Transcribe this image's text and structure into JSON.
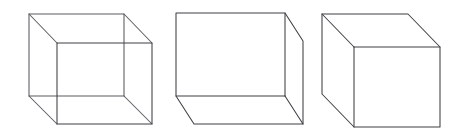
{
  "figure": {
    "name": "three-cube-drawings",
    "width": 460,
    "height": 136,
    "background_color": "#ffffff",
    "line_color": "#3f3f44",
    "hidden_line_color": "#5a5a60",
    "line_width": 1.05,
    "caption": "",
    "cubes": [
      {
        "id": "cube-wireframe",
        "label": "",
        "style": "wireframe-all-edges",
        "visible_edge_count": 12,
        "hidden_edges_drawn": true,
        "projection": "oblique-back-upper-left",
        "front_face": {
          "top_left": [
            57,
            43
          ],
          "top_right": [
            152,
            43
          ],
          "bottom_right": [
            152,
            124
          ],
          "bottom_left": [
            57,
            124
          ]
        },
        "back_face": {
          "top_left": [
            29,
            14
          ],
          "top_right": [
            124,
            14
          ],
          "bottom_right": [
            124,
            96
          ],
          "bottom_left": [
            29,
            96
          ]
        },
        "depth_offset": [
          -28,
          -29
        ]
      },
      {
        "id": "cube-hidden-removed-low",
        "label": "",
        "style": "hidden-lines-removed",
        "visible_edge_count": 9,
        "hidden_edges_drawn": false,
        "projection": "oblique-back-lower-right",
        "visible_faces": [
          "front",
          "right",
          "bottom"
        ],
        "front_face": {
          "top_left": [
            176,
            13
          ],
          "top_right": [
            285,
            13
          ],
          "bottom_right": [
            285,
            96
          ],
          "bottom_left": [
            176,
            96
          ]
        },
        "back_face": {
          "top_left": [
            194,
            41
          ],
          "top_right": [
            303,
            41
          ],
          "bottom_right": [
            303,
            124
          ],
          "bottom_left": [
            194,
            124
          ]
        },
        "depth_offset": [
          18,
          28
        ]
      },
      {
        "id": "cube-hidden-removed-high",
        "label": "",
        "style": "hidden-lines-removed",
        "visible_edge_count": 9,
        "hidden_edges_drawn": false,
        "projection": "oblique-back-upper-right",
        "visible_faces": [
          "front",
          "left",
          "top"
        ],
        "front_face": {
          "top_left": [
            354,
            47
          ],
          "top_right": [
            440,
            47
          ],
          "bottom_right": [
            440,
            127
          ],
          "bottom_left": [
            354,
            127
          ]
        },
        "back_face": {
          "top_left": [
            322,
            14
          ],
          "top_right": [
            408,
            14
          ],
          "bottom_right": [
            408,
            94
          ],
          "bottom_left": [
            322,
            94
          ]
        },
        "depth_offset": [
          -32,
          -33
        ]
      }
    ]
  }
}
